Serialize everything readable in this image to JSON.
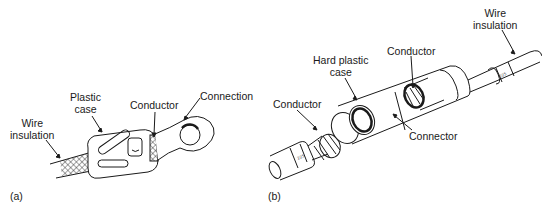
{
  "figure": {
    "panel_a": {
      "tag": "(a)",
      "labels": {
        "wire_insulation": [
          "Wire",
          "insulation"
        ],
        "plastic_case": [
          "Plastic",
          "case"
        ],
        "conductor": "Conductor",
        "connection": "Connection"
      }
    },
    "panel_b": {
      "tag": "(b)",
      "labels": {
        "wire_insulation": [
          "Wire",
          "insulation"
        ],
        "conductor_top": "Conductor",
        "hard_plastic_case": [
          "Hard plastic",
          "case"
        ],
        "conductor_left": "Conductor",
        "connector": "Connector"
      },
      "insulation_marking": "225"
    },
    "colors": {
      "line": "#1a1a1a",
      "background": "#ffffff"
    }
  }
}
